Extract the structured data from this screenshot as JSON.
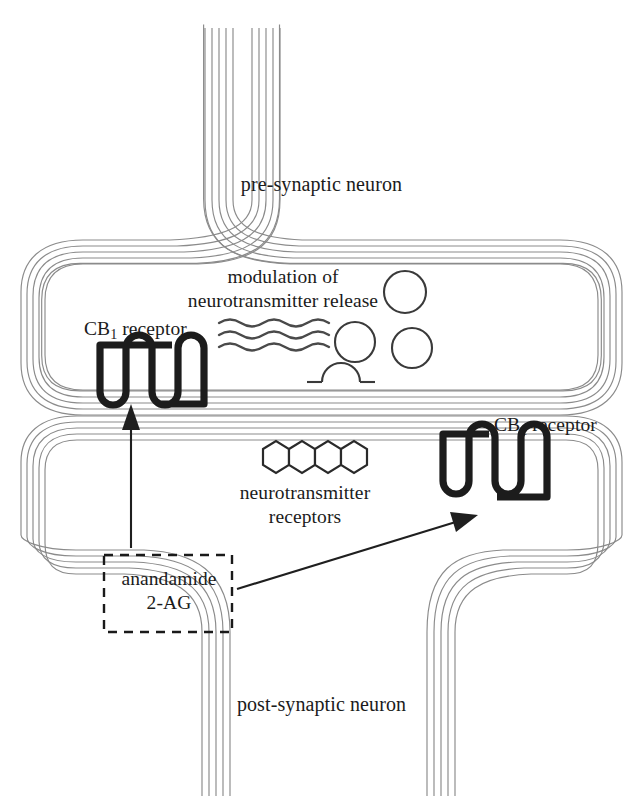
{
  "diagram": {
    "labels": {
      "pre_synaptic": "pre-synaptic neuron",
      "post_synaptic": "post-synaptic neuron",
      "modulation_line1": "modulation of",
      "modulation_line2": "neurotransmitter release",
      "cb1_receptor_upper_prefix": "CB",
      "cb1_receptor_upper_subscript": "1",
      "cb1_receptor_upper_suffix": " receptor",
      "cb1_receptor_lower_prefix": "CB",
      "cb1_receptor_lower_subscript": "1",
      "cb1_receptor_lower_suffix": " receptor",
      "nt_receptors_line1": "neurotransmitter",
      "nt_receptors_line2": "receptors",
      "endocannabinoid_line1": "anandamide",
      "endocannabinoid_line2": "2-AG"
    },
    "colors": {
      "background": "#ffffff",
      "membrane_stroke": "#8b8b8b",
      "receptor_stroke": "#1c1c1c",
      "vesicle_stroke": "#3a3a3a",
      "text": "#1b1b1b",
      "arrow": "#1f1f1f",
      "dashed_box": "#1a1a1a",
      "hexagon_stroke": "#2a2a2a",
      "wavy_stroke": "#4a4a4a"
    },
    "counts": {
      "membrane_lines_per_bilayer": 5,
      "vesicles_free": 3,
      "vesicles_fusing": 1,
      "neurotransmitter_receptor_hexagons": 4,
      "wavy_signal_lines": 3,
      "cb1_receptors": 2,
      "arrows": 2
    },
    "arrows": [
      {
        "name": "arrow-to-presynaptic-cb1",
        "from": "anandamide-2ag-box",
        "to": "cb1-receptor-presynaptic",
        "direction": "up"
      },
      {
        "name": "arrow-to-postsynaptic-cb1",
        "from": "anandamide-2ag-box",
        "to": "cb1-receptor-postsynaptic",
        "direction": "up-right"
      }
    ]
  }
}
